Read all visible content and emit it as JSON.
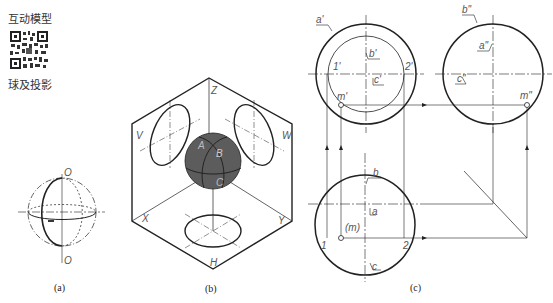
{
  "sidebar": {
    "interactive_label": "互动模型",
    "qr_icon": "qr-code-icon",
    "topic_label": "球及投影"
  },
  "figure_a": {
    "caption": "(a)",
    "top_label": "O",
    "bottom_label": "O"
  },
  "figure_b": {
    "caption": "(b)",
    "plane_labels": {
      "z": "Z",
      "v": "V",
      "w": "W",
      "x": "X",
      "y": "Y",
      "h": "H"
    },
    "point_labels": {
      "a": "A",
      "b": "B",
      "c": "C"
    },
    "sphere_color": "#5c5c5c"
  },
  "figure_c": {
    "caption": "(c)",
    "front_view": {
      "a": "a'",
      "b": "b'",
      "c": "c'",
      "p1": "1'",
      "p2": "2'",
      "m": "m'"
    },
    "side_view": {
      "a": "a\"",
      "b": "b\"",
      "c": "c\"",
      "m": "m\""
    },
    "top_view": {
      "a": "a",
      "b": "b",
      "c": "c",
      "p1": "1",
      "p2": "2",
      "m": "(m)"
    }
  }
}
